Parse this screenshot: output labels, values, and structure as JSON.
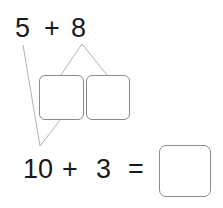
{
  "problem": {
    "top_expression": {
      "first": "5",
      "operator": "+",
      "second": "8"
    },
    "decomposition": {
      "of": "8",
      "parts": [
        "",
        ""
      ]
    },
    "bottom_expression": {
      "first": "10",
      "operator": "+",
      "second": "3",
      "equals": "=",
      "answer": ""
    }
  },
  "colors": {
    "text": "#1a1a1a",
    "box_border": "#8a8a8a",
    "line": "#a8a8a8"
  }
}
